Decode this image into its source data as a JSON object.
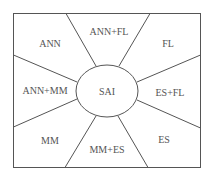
{
  "diagram": {
    "center": {
      "label": "SAI"
    },
    "regions": [
      {
        "id": "ann",
        "label": "ANN"
      },
      {
        "id": "ann-fl",
        "label": "ANN+FL"
      },
      {
        "id": "fl",
        "label": "FL"
      },
      {
        "id": "ann-mm",
        "label": "ANN+MM"
      },
      {
        "id": "es-fl",
        "label": "ES+FL"
      },
      {
        "id": "mm",
        "label": "MM"
      },
      {
        "id": "mm-es",
        "label": "MM+ES"
      },
      {
        "id": "es",
        "label": "ES"
      }
    ],
    "colors": {
      "line": "#555555",
      "text": "#555555",
      "background": "#ffffff"
    }
  }
}
